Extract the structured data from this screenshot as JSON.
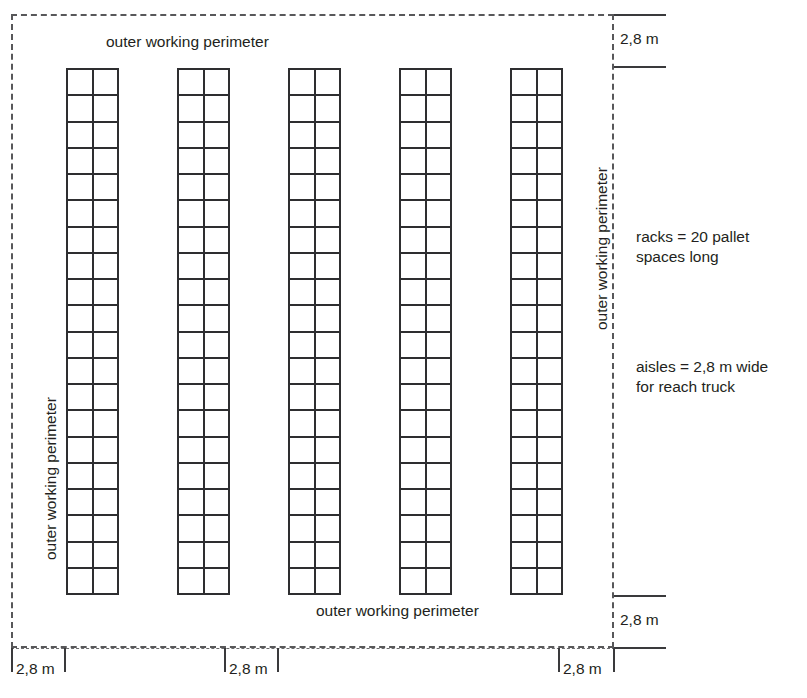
{
  "diagram": {
    "boundary_style": "dashed"
  },
  "labels": {
    "perimeter_top": "outer working perimeter",
    "perimeter_bottom": "outer working perimeter",
    "perimeter_left": "outer working perimeter",
    "perimeter_right": "outer working perimeter",
    "racks_note_line1": "racks = 20 pallet",
    "racks_note_line2": "spaces long",
    "aisles_note_line1": "aisles = 2,8 m wide",
    "aisles_note_line2": "for reach truck"
  },
  "dimensions": {
    "top_right": "2,8 m",
    "bottom_right": "2,8 m",
    "bottom_left": "2,8 m",
    "bottom_middle": "2,8 m",
    "bottom_right_inner": "2,8 m"
  },
  "racks": {
    "count": 5,
    "columns_per_rack": 2,
    "rows_per_rack": 20,
    "pallet_spaces_long": 20,
    "aisle_width_m": "2,8",
    "list": [
      {
        "id": "rack-1",
        "x": 66,
        "y": 68,
        "width": 53,
        "height": 527
      },
      {
        "id": "rack-2",
        "x": 177,
        "y": 68,
        "width": 53,
        "height": 527
      },
      {
        "id": "rack-3",
        "x": 288,
        "y": 68,
        "width": 53,
        "height": 527
      },
      {
        "id": "rack-4",
        "x": 399,
        "y": 68,
        "width": 53,
        "height": 527
      },
      {
        "id": "rack-5",
        "x": 510,
        "y": 68,
        "width": 53,
        "height": 527
      }
    ]
  },
  "colors": {
    "rack_stroke": "#2e2e30",
    "boundary": "#58585a",
    "text": "#231f20",
    "background": "#ffffff"
  }
}
